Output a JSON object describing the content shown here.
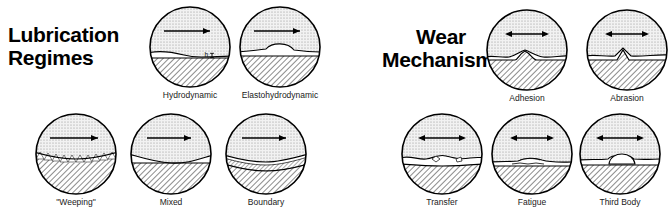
{
  "sections": [
    {
      "id": "lubrication",
      "title": "Lubrication\nRegimes",
      "arrow_type": "single-headed",
      "items": [
        {
          "key": "hydrodynamic",
          "label": "Hydrodynamic",
          "feature": "thick-film-gap",
          "gap_label": "h"
        },
        {
          "key": "elastohydrodynamic",
          "label": "Elastohydrodynamic",
          "feature": "deformed-film"
        },
        {
          "key": "weeping",
          "label": "\"Weeping\"",
          "feature": "weeping-spikes"
        },
        {
          "key": "mixed",
          "label": "Mixed",
          "feature": "partial-contact"
        },
        {
          "key": "boundary",
          "label": "Boundary",
          "feature": "boundary-layer"
        }
      ]
    },
    {
      "id": "wear",
      "title": "Wear\nMechanisms",
      "arrow_type": "double-headed",
      "items": [
        {
          "key": "adhesion",
          "label": "Adhesion",
          "feature": "adhesive-junction"
        },
        {
          "key": "abrasion",
          "label": "Abrasion",
          "feature": "abrasive-groove"
        },
        {
          "key": "transfer",
          "label": "Transfer",
          "feature": "transferred-fragment"
        },
        {
          "key": "fatigue",
          "label": "Fatigue",
          "feature": "subsurface-crack"
        },
        {
          "key": "third_body",
          "label": "Third Body",
          "feature": "loose-particle"
        }
      ]
    }
  ],
  "colors": {
    "outline": "#000000",
    "upper_body_fill": "#eeeeee",
    "lower_body_fill": "#c8c8c8",
    "film_fill": "#ffffff",
    "background": "#ffffff",
    "text": "#000000"
  }
}
